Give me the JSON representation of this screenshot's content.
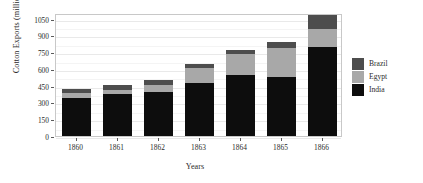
{
  "chart_data": {
    "type": "bar",
    "barmode": "stacked",
    "title": "",
    "xlabel": "Years",
    "ylabel": "Cotton Exports (millions lbs)",
    "categories": [
      "1860",
      "1861",
      "1862",
      "1863",
      "1864",
      "1865",
      "1866"
    ],
    "series": [
      {
        "name": "India",
        "color": "#0d0d0d",
        "values": [
          340,
          380,
          395,
          470,
          550,
          530,
          800
        ]
      },
      {
        "name": "Egypt",
        "color": "#a8a8a8",
        "values": [
          45,
          35,
          65,
          135,
          180,
          255,
          160
        ]
      },
      {
        "name": "Brazil",
        "color": "#4d4d4d",
        "values": [
          35,
          45,
          45,
          40,
          40,
          55,
          125
        ]
      }
    ],
    "totals": [
      420,
      460,
      505,
      645,
      770,
      840,
      1085
    ],
    "ylim": [
      0,
      1100
    ],
    "yticks": [
      0,
      150,
      300,
      450,
      600,
      750,
      900,
      1050
    ],
    "ytick_labels": [
      "0",
      "150",
      "300",
      "450",
      "600",
      "750",
      "900",
      "1050"
    ],
    "grid": true,
    "legend_position": "right",
    "legend_entries": [
      "Brazil",
      "Egypt",
      "India"
    ],
    "legend_title": ""
  }
}
